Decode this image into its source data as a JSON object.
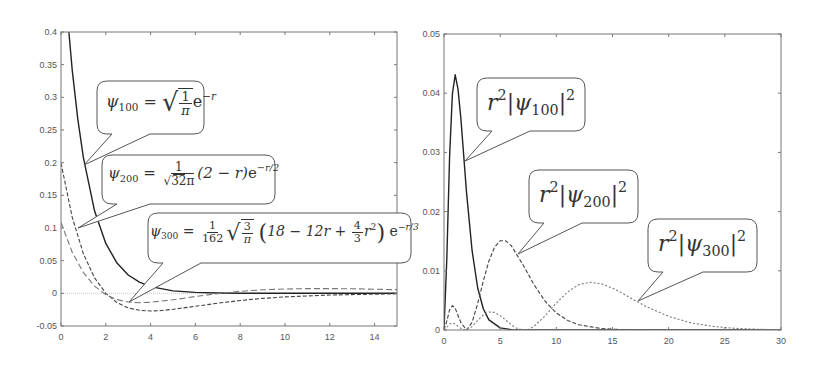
{
  "chart_data": [
    {
      "type": "line",
      "title": "",
      "xlabel": "",
      "ylabel": "",
      "xlim": [
        0,
        15
      ],
      "ylim": [
        -0.05,
        0.4
      ],
      "x_ticks": [
        0,
        2,
        4,
        6,
        8,
        10,
        12,
        14
      ],
      "y_ticks": [
        -0.05,
        0,
        0.05,
        0.1,
        0.15,
        0.2,
        0.25,
        0.3,
        0.35,
        0.4
      ],
      "x_tick_labels": [
        "0",
        "2",
        "4",
        "6",
        "8",
        "10",
        "12",
        "14"
      ],
      "y_tick_labels": [
        "-0.05",
        "0",
        "0.05",
        "0.1",
        "0.15",
        "0.2",
        "0.25",
        "0.3",
        "0.35",
        "0.4"
      ],
      "grid": false,
      "zero_line": true,
      "series": [
        {
          "name": "psi_100",
          "label": "ψ100 = sqrt(1/π) e^(-r)",
          "style": "solid",
          "color": "#222222",
          "x": [
            0,
            0.25,
            0.5,
            0.75,
            1,
            1.5,
            2,
            2.5,
            3,
            3.5,
            4,
            5,
            6,
            7,
            8,
            10,
            12,
            15
          ],
          "y": [
            0.5642,
            0.4394,
            0.3422,
            0.2665,
            0.2076,
            0.1259,
            0.0764,
            0.0463,
            0.0281,
            0.017,
            0.0103,
            0.0038,
            0.0014,
            0.0005,
            0.0002,
            3e-05,
            0.0,
            0.0
          ]
        },
        {
          "name": "psi_200",
          "label": "ψ200 = 1/sqrt(32π) (2 - r) e^(-r/2)",
          "style": "dashed",
          "color": "#444444",
          "x": [
            0,
            0.5,
            1,
            1.5,
            2,
            2.5,
            3,
            3.5,
            4,
            4.5,
            5,
            6,
            7,
            8,
            9,
            10,
            12,
            15
          ],
          "y": [
            0.1995,
            0.1165,
            0.0605,
            0.0236,
            0.0,
            -0.0143,
            -0.0223,
            -0.026,
            -0.027,
            -0.0263,
            -0.0245,
            -0.0199,
            -0.0151,
            -0.011,
            -0.0077,
            -0.0054,
            -0.0025,
            -0.0007
          ]
        },
        {
          "name": "psi_300",
          "label": "ψ300 = 1/162 sqrt(3/π) (18 - 12r + 4/3 r²) e^(-r/3)",
          "style": "long-dashed",
          "color": "#777777",
          "x": [
            0,
            0.5,
            1,
            1.5,
            2,
            2.5,
            3,
            3.5,
            4,
            5,
            6,
            7,
            8,
            9,
            10,
            11,
            12,
            13,
            14,
            15
          ],
          "y": [
            0.1086,
            0.063,
            0.0317,
            0.011,
            -0.0021,
            -0.0096,
            -0.0133,
            -0.0144,
            -0.0138,
            -0.0099,
            -0.0049,
            -0.0004,
            0.0031,
            0.0054,
            0.0067,
            0.0073,
            0.0073,
            0.0069,
            0.0063,
            0.0056
          ]
        }
      ]
    },
    {
      "type": "line",
      "title": "",
      "xlabel": "",
      "ylabel": "",
      "xlim": [
        0,
        30
      ],
      "ylim": [
        0,
        0.05
      ],
      "x_ticks": [
        0,
        5,
        10,
        15,
        20,
        25,
        30
      ],
      "y_ticks": [
        0,
        0.01,
        0.02,
        0.03,
        0.04,
        0.05
      ],
      "x_tick_labels": [
        "0",
        "5",
        "10",
        "15",
        "20",
        "25",
        "30"
      ],
      "y_tick_labels": [
        "0",
        "0.01",
        "0.02",
        "0.03",
        "0.04",
        "0.05"
      ],
      "grid": false,
      "series": [
        {
          "name": "r2_psi_100_sq",
          "label": "r²|ψ100|²",
          "style": "solid",
          "color": "#222222",
          "x": [
            0,
            0.25,
            0.5,
            0.75,
            1,
            1.25,
            1.5,
            2,
            2.5,
            3,
            3.5,
            4,
            5,
            6,
            7,
            30
          ],
          "y": [
            0,
            0.012,
            0.0293,
            0.0399,
            0.0431,
            0.0407,
            0.0357,
            0.0233,
            0.0134,
            0.0071,
            0.0036,
            0.0017,
            0.00036,
            7e-05,
            0,
            0
          ]
        },
        {
          "name": "r2_psi_200_sq",
          "label": "r²|ψ200|²",
          "style": "dashed",
          "color": "#444444",
          "x": [
            0,
            0.25,
            0.5,
            0.75,
            1,
            1.5,
            2,
            2.5,
            3,
            3.5,
            4,
            4.5,
            5,
            5.5,
            6,
            7,
            8,
            9,
            10,
            11,
            12,
            14,
            16,
            18,
            20,
            30
          ],
          "y": [
            0,
            0.00148,
            0.00339,
            0.00413,
            0.00366,
            0.00125,
            0,
            0.00128,
            0.00446,
            0.00828,
            0.01166,
            0.01398,
            0.01508,
            0.01507,
            0.01421,
            0.01111,
            0.00768,
            0.00487,
            0.00289,
            0.00163,
            0.00088,
            0.00023,
            5.6e-05,
            1e-05,
            0,
            0
          ]
        },
        {
          "name": "r2_psi_300_sq",
          "label": "r²|ψ300|²",
          "style": "dotted",
          "color": "#777777",
          "x": [
            0,
            0.25,
            0.5,
            0.75,
            1,
            1.25,
            1.5,
            1.9,
            2,
            2.5,
            3,
            3.5,
            4,
            4.5,
            5,
            5.5,
            6,
            6.5,
            7,
            7.5,
            8,
            9,
            10,
            11,
            12,
            13,
            14,
            15,
            16,
            17,
            18,
            20,
            22,
            24,
            26,
            28,
            30
          ],
          "y": [
            0,
            0.000438,
            0.000991,
            0.00118,
            0.001,
            0.00064,
            0.000271,
            0,
            1.7e-05,
            0.000577,
            0.0016,
            0.00254,
            0.00304,
            0.00297,
            0.00244,
            0.00166,
            0.000863,
            0.000271,
            7.5e-06,
            0.000124,
            0.000605,
            0.00237,
            0.00454,
            0.00644,
            0.00765,
            0.00807,
            0.00781,
            0.00708,
            0.00608,
            0.005,
            0.00396,
            0.00229,
            0.0012,
            0.000585,
            0.000269,
            0.000118,
            4.97e-05
          ]
        }
      ]
    }
  ],
  "callouts": {
    "psi100": {
      "lhs": "ψ",
      "sub": "100",
      "eq": "=",
      "frac_num": "1",
      "frac_den": "π",
      "exp_base": "e",
      "exp": "−r"
    },
    "psi200": {
      "lhs": "ψ",
      "sub": "200",
      "eq": "=",
      "frac_num": "1",
      "frac_den_rad": "32π",
      "mid": "(2 − r)",
      "exp_base": "e",
      "exp": "−r/2"
    },
    "psi300": {
      "lhs": "ψ",
      "sub": "300",
      "eq": "=",
      "frac_num": "1",
      "frac_den": "162",
      "sqrt_num": "3",
      "sqrt_den": "π",
      "poly_a": "18 − 12r +",
      "poly_frac_num": "4",
      "poly_frac_den": "3",
      "poly_b": "r",
      "poly_b_sup": "2",
      "exp_base": "e",
      "exp": "−r/3"
    },
    "r2psi100": {
      "r": "r",
      "r_sup": "2",
      "bar_open": "|",
      "psi": "ψ",
      "sub": "100",
      "bar_close": "|",
      "sup": "2"
    },
    "r2psi200": {
      "r": "r",
      "r_sup": "2",
      "bar_open": "|",
      "psi": "ψ",
      "sub": "200",
      "bar_close": "|",
      "sup": "2"
    },
    "r2psi300": {
      "r": "r",
      "r_sup": "2",
      "bar_open": "|",
      "psi": "ψ",
      "sub": "300",
      "bar_close": "|",
      "sup": "2"
    }
  }
}
